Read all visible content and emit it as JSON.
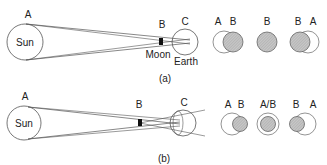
{
  "panel_a": {
    "label_A": "A",
    "label_B": "B",
    "label_C": "C",
    "sun_label": "Sun",
    "moon_label": "Moon",
    "earth_label": "Earth",
    "caption": "(a)",
    "views": [
      {
        "left": "A",
        "right": "B"
      },
      {
        "center": "B"
      },
      {
        "left": "B",
        "right": "A"
      }
    ]
  },
  "panel_b": {
    "label_A": "A",
    "label_B": "B",
    "label_C": "C",
    "sun_label": "Sun",
    "caption": "(b)",
    "views": [
      {
        "left": "A",
        "right": "B"
      },
      {
        "center": "A/B"
      },
      {
        "left": "B",
        "right": "A"
      }
    ]
  },
  "colors": {
    "line": "#555555",
    "shade": "#bdbdbd"
  }
}
